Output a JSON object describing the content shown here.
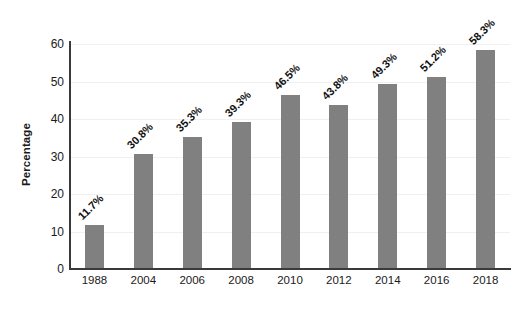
{
  "chart_data": {
    "type": "bar",
    "title": "",
    "xlabel": "",
    "ylabel": "Percentage",
    "categories": [
      "1988",
      "2004",
      "2006",
      "2008",
      "2010",
      "2012",
      "2014",
      "2016",
      "2018"
    ],
    "values": [
      11.7,
      30.8,
      35.3,
      39.3,
      46.5,
      43.8,
      49.3,
      51.2,
      58.3
    ],
    "data_labels": [
      "11.7%",
      "30.8%",
      "35.3%",
      "39.3%",
      "46.5%",
      "43.8%",
      "49.3%",
      "51.2%",
      "58.3%"
    ],
    "ylim": [
      0,
      60
    ],
    "y_ticks": [
      "0",
      "10",
      "20",
      "30",
      "40",
      "50",
      "60"
    ],
    "y_tick_values": [
      0,
      10,
      20,
      30,
      40,
      50,
      60
    ],
    "grid": true,
    "legend": null,
    "bar_color": "#808080",
    "background_color": "#ffffff",
    "axis_color": "#3a3a3a",
    "gridline_color": "#eef0f1",
    "data_label_rotation_deg": 45,
    "ylabel_rotation_deg": 90
  }
}
